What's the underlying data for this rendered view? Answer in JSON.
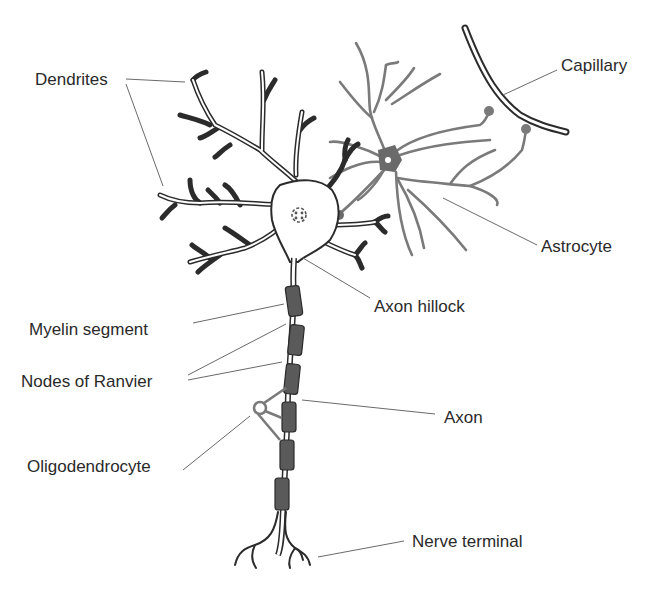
{
  "diagram": {
    "colors": {
      "neuron_outline": "#2b2b2b",
      "astrocyte": "#7a7a7a",
      "myelin": "#5a5a5a",
      "leader_line": "#6a6a6a",
      "label_text": "#2a2a2a",
      "background": "#ffffff"
    },
    "labels": [
      {
        "id": "dendrites",
        "text": "Dendrites",
        "x": 35,
        "y": 71
      },
      {
        "id": "capillary",
        "text": "Capillary",
        "x": 561,
        "y": 57
      },
      {
        "id": "astrocyte",
        "text": "Astrocyte",
        "x": 541,
        "y": 238
      },
      {
        "id": "axon-hillock",
        "text": "Axon hillock",
        "x": 374,
        "y": 298
      },
      {
        "id": "myelin-segment",
        "text": "Myelin segment",
        "x": 29,
        "y": 321
      },
      {
        "id": "nodes-of-ranvier",
        "text": "Nodes of Ranvier",
        "x": 21,
        "y": 373
      },
      {
        "id": "axon",
        "text": "Axon",
        "x": 444,
        "y": 409
      },
      {
        "id": "oligodendrocyte",
        "text": "Oligodendrocyte",
        "x": 27,
        "y": 458
      },
      {
        "id": "nerve-terminal",
        "text": "Nerve terminal",
        "x": 412,
        "y": 533
      }
    ]
  }
}
